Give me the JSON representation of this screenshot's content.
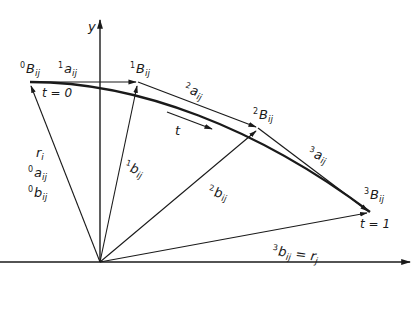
{
  "diagram": {
    "axes": {
      "y_label": "y"
    },
    "points": [
      {
        "id": "B0",
        "sup": "0",
        "base": "B",
        "sub": "ij",
        "x": 30,
        "y": 82
      },
      {
        "id": "B1",
        "sup": "1",
        "base": "B",
        "sub": "ij",
        "x": 138,
        "y": 82
      },
      {
        "id": "B2",
        "sup": "2",
        "base": "B",
        "sub": "ij",
        "x": 258,
        "y": 128
      },
      {
        "id": "B3",
        "sup": "3",
        "base": "B",
        "sub": "ij",
        "x": 370,
        "y": 212
      }
    ],
    "edge_vectors": [
      {
        "sup": "1",
        "base": "a",
        "sub": "ij"
      },
      {
        "sup": "2",
        "base": "a",
        "sub": "ij"
      },
      {
        "sup": "3",
        "base": "a",
        "sub": "ij"
      }
    ],
    "position_vectors": [
      {
        "sup": "1",
        "base": "b",
        "sub": "ij"
      },
      {
        "sup": "2",
        "base": "b",
        "sub": "ij"
      },
      {
        "sup": "3",
        "base": "b",
        "sub": "ij",
        "suffix": "= r",
        "suffix_sub": "j"
      }
    ],
    "left_vector_labels": [
      {
        "sup": "",
        "base": "r",
        "sub": "i"
      },
      {
        "sup": "0",
        "base": "a",
        "sub": "ij"
      },
      {
        "sup": "0",
        "base": "b",
        "sub": "ij"
      }
    ],
    "parameter": {
      "t_label": "t",
      "start": "t = 0",
      "end": "t = 1"
    }
  }
}
